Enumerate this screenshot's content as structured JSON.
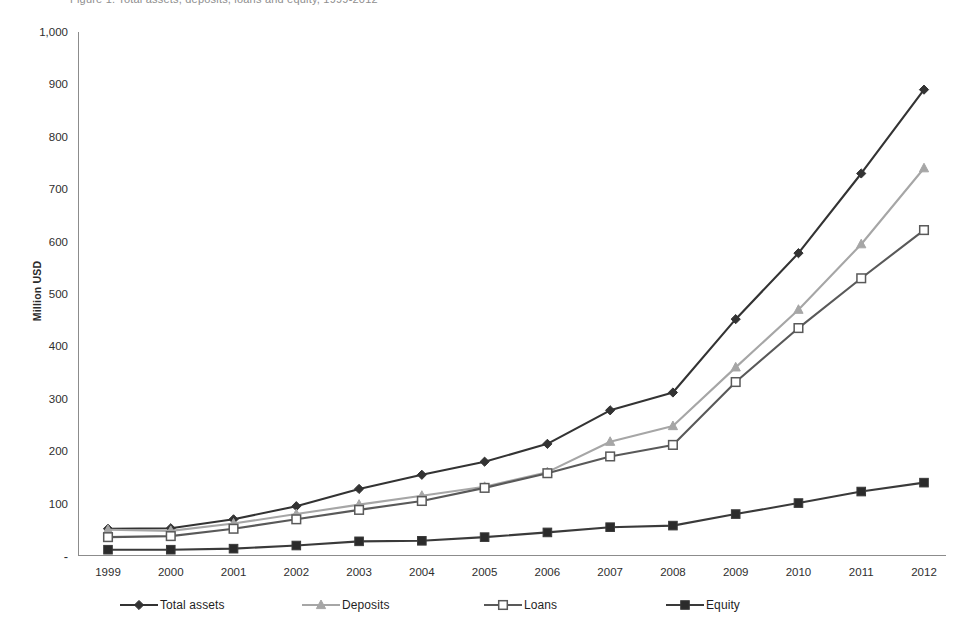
{
  "figure": {
    "caption_clipped": "Figure 1. Total assets, deposits, loans and equity, 1999-2012",
    "ylabel": "Million USD",
    "xlabel": ""
  },
  "chart_data": {
    "type": "line",
    "title": "",
    "xlabel": "",
    "ylabel": "Million USD",
    "ylim": [
      0,
      1000
    ],
    "ytick_step": 100,
    "grid": false,
    "legend_position": "bottom",
    "zero_tick_label": "-",
    "ytick_labels": [
      "1,000",
      "900",
      "800",
      "700",
      "600",
      "500",
      "400",
      "300",
      "200",
      "100",
      "-"
    ],
    "ytick_values": [
      1000,
      900,
      800,
      700,
      600,
      500,
      400,
      300,
      200,
      100,
      0
    ],
    "categories": [
      "1999",
      "2000",
      "2001",
      "2002",
      "2003",
      "2004",
      "2005",
      "2006",
      "2007",
      "2008",
      "2009",
      "2010",
      "2011",
      "2012"
    ],
    "series": [
      {
        "name": "Total assets",
        "marker": "diamond",
        "color": "#333333",
        "fill": "#333333",
        "values": [
          52,
          53,
          70,
          95,
          128,
          155,
          180,
          214,
          278,
          312,
          452,
          578,
          730,
          890
        ]
      },
      {
        "name": "Deposits",
        "marker": "triangle",
        "color": "#a6a6a6",
        "fill": "#a6a6a6",
        "values": [
          50,
          48,
          62,
          80,
          98,
          115,
          132,
          160,
          218,
          248,
          360,
          470,
          595,
          740
        ]
      },
      {
        "name": "Loans",
        "marker": "square-open",
        "color": "#595959",
        "fill": "#ffffff",
        "values": [
          36,
          38,
          52,
          70,
          88,
          105,
          130,
          158,
          190,
          212,
          332,
          435,
          530,
          622
        ]
      },
      {
        "name": "Equity",
        "marker": "square",
        "color": "#3a3a3a",
        "fill": "#2b2b2b",
        "values": [
          12,
          12,
          14,
          20,
          28,
          29,
          36,
          45,
          55,
          58,
          80,
          101,
          123,
          140
        ]
      }
    ]
  }
}
